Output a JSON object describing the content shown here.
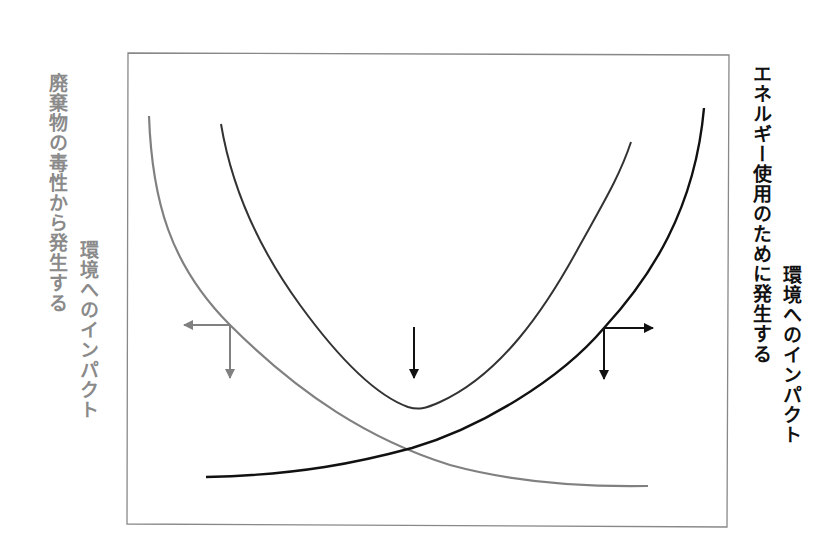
{
  "diagram": {
    "type": "tradeoff-curves",
    "left_axis_label": {
      "line1": "廃棄物の毒性から発生する",
      "line2": "環境へのインパクト",
      "color": "#8a8a8a"
    },
    "right_axis_label": {
      "line1": "エネルギー使用のために発生する",
      "line2": "環境へのインパクト",
      "color": "#111111"
    },
    "curves": [
      {
        "name": "waste-toxicity-impact",
        "color": "#808080",
        "shape": "decreasing"
      },
      {
        "name": "energy-use-impact",
        "color": "#111111",
        "shape": "increasing"
      },
      {
        "name": "total-impact",
        "color": "#333333",
        "shape": "u-shaped"
      }
    ],
    "arrows": [
      {
        "name": "left-axis-indicator",
        "color": "#808080",
        "directions": [
          "left",
          "down"
        ]
      },
      {
        "name": "minimum-indicator",
        "color": "#111111",
        "directions": [
          "down"
        ]
      },
      {
        "name": "right-axis-indicator",
        "color": "#111111",
        "directions": [
          "right",
          "down"
        ]
      }
    ],
    "frame_color": "#888888"
  }
}
